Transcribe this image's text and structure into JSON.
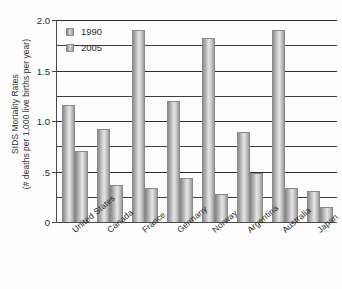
{
  "chart_data": {
    "type": "bar",
    "title": "",
    "xlabel": "",
    "ylabel": "SIDS Mortality Rates (# deaths per 1,000 live births per year)",
    "ylabel_line1": "SIDS Mortality Rates",
    "ylabel_line2": "(# deaths per 1,000 live births per year)",
    "ylim": [
      0,
      2.0
    ],
    "ytick_labels": [
      "2.0",
      "1.5",
      "1.0",
      ".5",
      "0"
    ],
    "ytick_values": [
      2.0,
      1.5,
      1.0,
      0.5,
      0
    ],
    "gridlines": [
      2.0,
      1.75,
      1.5,
      1.25,
      1.0,
      0.75,
      0.5,
      0.25
    ],
    "grid": true,
    "legend_position": "top-left",
    "categories": [
      "United States",
      "Canada",
      "France",
      "Germany",
      "Norway",
      "Argentina",
      "Australia",
      "Japan"
    ],
    "series": [
      {
        "name": "1990",
        "values": [
          1.16,
          0.92,
          1.9,
          1.2,
          1.82,
          0.89,
          1.9,
          0.31
        ]
      },
      {
        "name": "2005",
        "values": [
          0.7,
          0.37,
          0.34,
          0.44,
          0.28,
          0.49,
          0.34,
          0.15
        ]
      }
    ]
  },
  "legend": {
    "items": [
      {
        "label": "1990"
      },
      {
        "label": "2005"
      }
    ]
  }
}
